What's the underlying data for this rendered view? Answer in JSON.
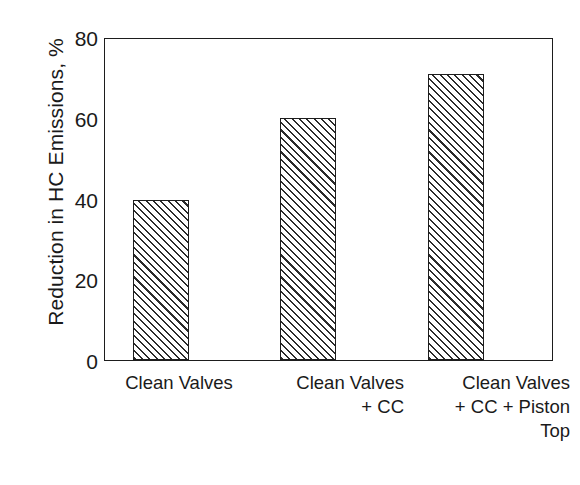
{
  "chart_data": {
    "type": "bar",
    "title": "",
    "xlabel": "",
    "ylabel": "Reduction in HC Emissions, %",
    "categories": [
      "Clean Valves",
      "Clean  Valves\n+ CC",
      "Clean Valves\n+ CC + Piston\nTop"
    ],
    "values": [
      39.8,
      60.2,
      71.2
    ],
    "ylim": [
      0,
      80
    ],
    "y_ticks": [
      0,
      20,
      40,
      60,
      80
    ],
    "y_tick_labels": [
      "0",
      "20",
      "40",
      "60",
      "80"
    ],
    "grid": false,
    "legend": false,
    "bar_fill": "diagonal-hatch",
    "bar_color": "#ffffff",
    "bar_edge_color": "#1d1d1d",
    "background_color": "#ffffff",
    "text_color": "#1a1a1a"
  },
  "axes": {
    "y_title": "Reduction in HC Emissions, %",
    "y_tick_labels": [
      "80",
      "60",
      "40",
      "20",
      "0"
    ]
  },
  "x_axis": {
    "labels": [
      "Clean Valves",
      "Clean  Valves\n+ CC",
      "Clean Valves\n+ CC + Piston\nTop"
    ]
  }
}
